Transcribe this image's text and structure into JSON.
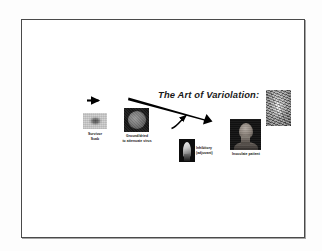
{
  "slide": {
    "title": "The Art of Variolation:",
    "background_color": "#ffffff",
    "frame_border_color": "#4a4a4a"
  },
  "steps": [
    {
      "id": "survivor-scab",
      "caption": "Survivor\nScab",
      "image_name": "survivor-scab-photo",
      "image_description": "grayscale close-up of a dried smallpox scab"
    },
    {
      "id": "ground-dish",
      "caption": "Ground/dried\nto attenuate virus",
      "image_name": "ground-dried-dish-photo",
      "image_description": "dark photo of a round dish holding ground dried scab material"
    },
    {
      "id": "lancet",
      "caption": "Inhibitory\n(adjuvant)",
      "image_name": "lancet-photo",
      "image_description": "dark photo of a metal lancet blade used for inoculation"
    },
    {
      "id": "patient",
      "caption": "Inoculate patient",
      "image_name": "inoculated-patient-photo",
      "image_description": "dark photo of the back of a patient's head and neck"
    }
  ],
  "engraving": {
    "image_name": "historical-engraving",
    "image_description": "grainy vertical historical engraving of a variolation scene"
  },
  "arrows": [
    {
      "name": "arrow-scab-to-dish",
      "from": "survivor-scab",
      "to": "ground-dish",
      "style": "straight-horizontal"
    },
    {
      "name": "arrow-dish-to-patient",
      "from": "ground-dish",
      "to": "patient",
      "style": "thick-diagonal"
    },
    {
      "name": "arrow-lancet-to-patient",
      "from": "lancet",
      "to": "patient",
      "style": "curved"
    }
  ]
}
